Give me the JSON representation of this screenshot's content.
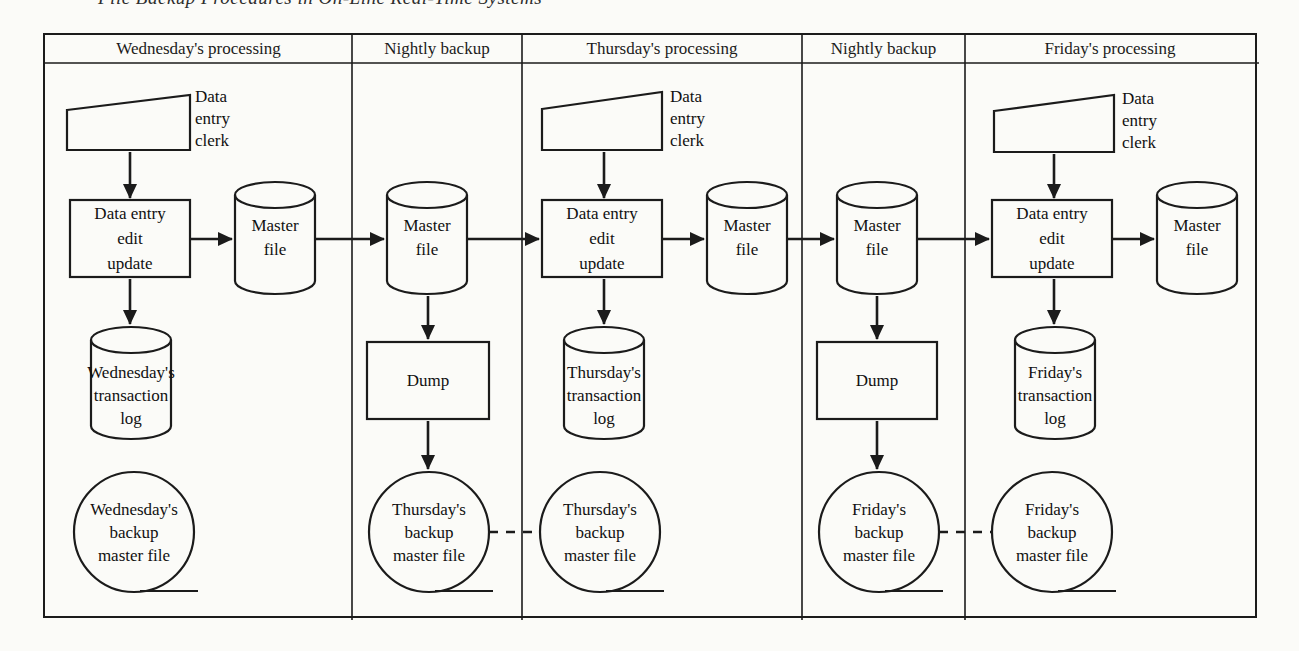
{
  "page": {
    "running_title": "File Backup Procedures in On-Line Real-Time Systems",
    "ink_color": "#1b1b1b",
    "paper_color": "#fbfbf8"
  },
  "columns": [
    {
      "header": "Wednesday's processing",
      "clerk": [
        "Data",
        "entry",
        "clerk"
      ],
      "edit_box": [
        "Data entry",
        "edit",
        "update"
      ],
      "master_file": [
        "Master",
        "file"
      ],
      "transaction_log": [
        "Wednesday's",
        "transaction",
        "log"
      ],
      "backup_circle": [
        "Wednesday's",
        "backup",
        "master file"
      ]
    },
    {
      "header": "Nightly backup",
      "master_file": [
        "Master",
        "file"
      ],
      "dump_box": "Dump",
      "backup_circle": [
        "Thursday's",
        "backup",
        "master file"
      ]
    },
    {
      "header": "Thursday's processing",
      "clerk": [
        "Data",
        "entry",
        "clerk"
      ],
      "edit_box": [
        "Data entry",
        "edit",
        "update"
      ],
      "master_file": [
        "Master",
        "file"
      ],
      "transaction_log": [
        "Thursday's",
        "transaction",
        "log"
      ],
      "backup_circle": [
        "Thursday's",
        "backup",
        "master file"
      ]
    },
    {
      "header": "Nightly backup",
      "master_file": [
        "Master",
        "file"
      ],
      "dump_box": "Dump",
      "backup_circle": [
        "Friday's",
        "backup",
        "master file"
      ]
    },
    {
      "header": "Friday's processing",
      "clerk": [
        "Data",
        "entry",
        "clerk"
      ],
      "edit_box": [
        "Data entry",
        "edit",
        "update"
      ],
      "master_file": [
        "Master",
        "file"
      ],
      "transaction_log": [
        "Friday's",
        "transaction",
        "log"
      ],
      "backup_circle": [
        "Friday's",
        "backup",
        "master file"
      ]
    }
  ]
}
